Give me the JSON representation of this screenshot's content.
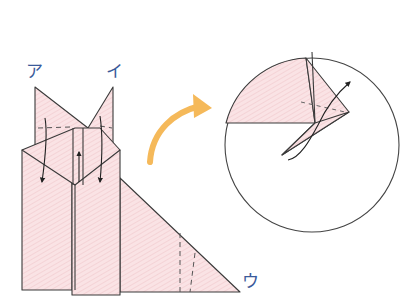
{
  "diagram": {
    "type": "origami-instruction-step",
    "labels": {
      "point_a": "ア",
      "point_i": "イ",
      "point_u": "ウ"
    },
    "colors": {
      "paper": "#f9dde0",
      "paper_hatch": "#efc4c9",
      "line": "#3a3a3a",
      "label": "#3a5a9a",
      "transition_arrow": "#f5b95a"
    },
    "main_figure": {
      "description": "Folded paper with two pointed flaps at top (ア, イ), diamond fold in middle, long right triangle extending to ウ",
      "fold_arrows": [
        "down-left",
        "up-center",
        "down-right"
      ],
      "valley_fold_lines": [
        "ear-left",
        "ear-right",
        "triangle-right"
      ]
    },
    "detail_inset": {
      "shape": "circle",
      "description": "Close-up of a flap being folded outward along dashed crease",
      "arrow": "curved-outward"
    },
    "transition_arrow": "curved orange arrow pointing right toward inset"
  }
}
